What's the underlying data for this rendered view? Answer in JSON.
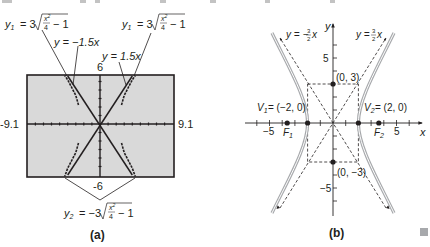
{
  "panel_a": {
    "caption": "(a)",
    "window": {
      "xmin": "-9.1",
      "xmax": "9.1",
      "ymax": "6",
      "ymin": "-6"
    },
    "screen_bg": "#d9d9d9",
    "labels": {
      "y1_left": {
        "lhs": "y",
        "sub": "1",
        "coef": "= 3",
        "num": "x",
        "exp": "2",
        "den": "4",
        "tail": "− 1"
      },
      "y1_right": {
        "lhs": "y",
        "sub": "1",
        "coef": "= 3",
        "num": "x",
        "exp": "2",
        "den": "4",
        "tail": "− 1"
      },
      "neg_asymptote": "y = −1.5x",
      "pos_asymptote": "y = 1.5x",
      "y2": {
        "lhs": "y",
        "sub": "2",
        "coef": "= −3",
        "num": "x",
        "exp": "2",
        "den": "4",
        "tail": "− 1"
      }
    }
  },
  "panel_b": {
    "caption": "(b)",
    "axis_x_label": "x",
    "axis_y_label": "y",
    "ticks": {
      "x_neg": "−5",
      "x_pos": "5",
      "y_pos": "5",
      "y_neg": "−5"
    },
    "points": {
      "top": "(0, 3)",
      "bottom": "(0, −3)",
      "v1": {
        "name": "V",
        "sub": "1",
        "value": "= (−2, 0)"
      },
      "v2": {
        "name": "V",
        "sub": "2",
        "value": "= (2, 0)"
      },
      "f1": {
        "name": "F",
        "sub": "1"
      },
      "f2": {
        "name": "F",
        "sub": "2"
      }
    },
    "asymptote_left": {
      "lhs": "y = −",
      "num": "3",
      "den": "2",
      "var": "x"
    },
    "asymptote_right": {
      "lhs": "y = ",
      "num": "3",
      "den": "2",
      "var": "x"
    },
    "curve_color": "#a7a9ac"
  },
  "end_marker_color": "#a7a9ac"
}
